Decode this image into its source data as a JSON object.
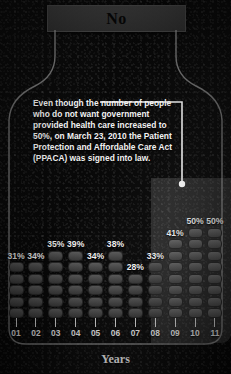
{
  "header": {
    "title": "No"
  },
  "annotation": {
    "text": "Even though the number of people who do not want government provided health care increased to 50%, on March 23, 2010 the Patient Protection and Affordable Care Act (PPACA) was signed into law."
  },
  "axis": {
    "title": "Years"
  },
  "colors": {
    "background": "#0b0b0b",
    "banner": "#363636",
    "bar": "#4e4e4e",
    "highlight": "rgba(215,215,215,0.17)",
    "text": "#f2f2f2"
  },
  "chart_data": {
    "type": "bar",
    "title": "No",
    "xlabel": "Years",
    "ylabel": "",
    "categories": [
      "01",
      "02",
      "03",
      "04",
      "05",
      "06",
      "07",
      "08",
      "09",
      "10",
      "11"
    ],
    "values": [
      31,
      34,
      35,
      39,
      34,
      38,
      28,
      33,
      41,
      50,
      50
    ],
    "value_labels": [
      "31%",
      "34%",
      "35%",
      "39%",
      "34%",
      "38%",
      "28%",
      "33%",
      "41%",
      "50%",
      "50%"
    ],
    "segments": [
      5,
      5,
      6,
      6,
      5,
      6,
      4,
      5,
      7,
      8,
      8
    ],
    "highlighted_categories": [
      "09",
      "10",
      "11"
    ],
    "ylim": [
      0,
      50
    ],
    "grid": false,
    "legend": null,
    "annotations": [
      {
        "text": "Even though the number of people who do not want government provided health care increased to 50%, on March 23, 2010 the Patient Protection and Affordable Care Act (PPACA) was signed into law.",
        "points_to": "10",
        "points_to_value": "50%"
      }
    ]
  }
}
